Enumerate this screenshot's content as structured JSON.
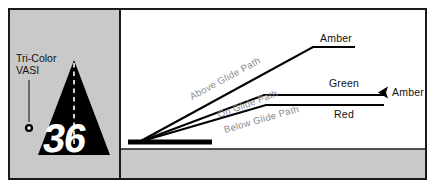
{
  "figure": {
    "panels": {
      "left": {
        "name": "runway-threshold-panel",
        "caption_line1": "Tri-Color",
        "caption_line2": "VASI",
        "runway_number": "36",
        "background_color": "#c9c9c9",
        "runway_color": "#000000",
        "centerline_color": "#ffffff"
      },
      "right": {
        "name": "glide-path-panel",
        "sky_color": "#ffffff",
        "ground_color": "#c9c9c9",
        "runway_color": "#000000",
        "paths": [
          {
            "id": "above-glide-path",
            "label": "Above Glide Path",
            "indication": "Amber",
            "indication_color": "#111111"
          },
          {
            "id": "on-glide-path",
            "label": "On Glide Path",
            "indication": "Green",
            "indication_color": "#111111"
          },
          {
            "id": "below-glide-path",
            "label": "Below Glide Path",
            "indication": "Red",
            "indication_color": "#111111"
          }
        ],
        "pointer_label": "Amber",
        "pointer_icon": "left-arrow-icon"
      }
    },
    "frame_color": "#1a1a1a"
  }
}
